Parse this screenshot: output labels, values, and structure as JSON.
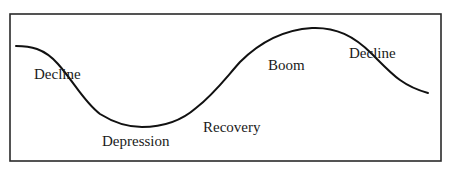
{
  "diagram": {
    "type": "business-cycle-wave",
    "frame": {
      "x": 10,
      "y": 14,
      "width": 431,
      "height": 147,
      "stroke": "#2a2a2a"
    },
    "curve": {
      "stroke": "#111111",
      "path": "M16,46 C30,46 44,48 58,64 C74,82 84,102 100,114 C116,124 128,127 142,127 C160,127 180,122 196,108 C214,94 224,80 240,62 C256,46 280,30 312,28 C336,27 354,36 372,54 C392,74 402,86 428,93"
    },
    "labels": [
      {
        "id": "decline-1",
        "text": "Decline",
        "x": 34,
        "y": 67
      },
      {
        "id": "depression",
        "text": "Depression",
        "x": 102,
        "y": 134
      },
      {
        "id": "recovery",
        "text": "Recovery",
        "x": 203,
        "y": 120
      },
      {
        "id": "boom",
        "text": "Boom",
        "x": 268,
        "y": 58
      },
      {
        "id": "decline-2",
        "text": "Decline",
        "x": 349,
        "y": 46
      }
    ]
  }
}
